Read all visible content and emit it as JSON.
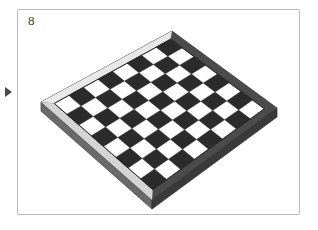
{
  "figure": {
    "number_label": "8",
    "caption": "",
    "marker_icon": "triangle-right-icon",
    "panel_border_color": "#b9b9b9",
    "background_color": "#ffffff"
  },
  "board": {
    "name": "chessboard",
    "ranks": 8,
    "files": 8,
    "total_squares": 64,
    "projection": "isometric",
    "light_square_color": "#fdfdfd",
    "dark_square_color": "#2b2b2b",
    "frame_color": "#4b4b4b",
    "frame_highlight_color": "#e8e8e8",
    "side_color": "#6a6a6a",
    "side_shadow_color": "#3a3a3a",
    "corners": {
      "left": [
        41,
        102
      ],
      "top": [
        172,
        31
      ],
      "right": [
        277,
        108
      ],
      "bottom": [
        152,
        200
      ]
    },
    "light_corner_square": "left",
    "rows": [
      [
        "light",
        "dark",
        "light",
        "dark",
        "light",
        "dark",
        "light",
        "dark"
      ],
      [
        "dark",
        "light",
        "dark",
        "light",
        "dark",
        "light",
        "dark",
        "light"
      ],
      [
        "light",
        "dark",
        "light",
        "dark",
        "light",
        "dark",
        "light",
        "dark"
      ],
      [
        "dark",
        "light",
        "dark",
        "light",
        "dark",
        "light",
        "dark",
        "light"
      ],
      [
        "light",
        "dark",
        "light",
        "dark",
        "light",
        "dark",
        "light",
        "dark"
      ],
      [
        "dark",
        "light",
        "dark",
        "light",
        "dark",
        "light",
        "dark",
        "light"
      ],
      [
        "light",
        "dark",
        "light",
        "dark",
        "light",
        "dark",
        "light",
        "dark"
      ],
      [
        "dark",
        "light",
        "dark",
        "light",
        "dark",
        "light",
        "dark",
        "light"
      ]
    ]
  }
}
